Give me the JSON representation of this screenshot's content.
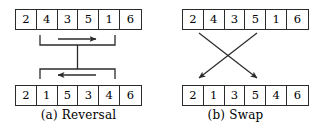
{
  "figure": {
    "panels": [
      {
        "id": "reversal",
        "caption_tag": "(a)",
        "caption_label": "Reversal",
        "input_array": {
          "label": "input-array",
          "values": [
            "2",
            "4",
            "3",
            "5",
            "1",
            "6"
          ]
        },
        "output_array": {
          "label": "output-array",
          "values": [
            "2",
            "1",
            "5",
            "3",
            "4",
            "6"
          ]
        },
        "operation": {
          "type": "reversal",
          "upper_bracket": {
            "arrow_direction": "right",
            "arrow_glyph": "→",
            "spans_indices": [
              1,
              4
            ]
          },
          "lower_bracket": {
            "arrow_direction": "left",
            "arrow_glyph": "←",
            "spans_indices": [
              1,
              4
            ]
          },
          "connector": "vertical-line"
        }
      },
      {
        "id": "swap",
        "caption_tag": "(b)",
        "caption_label": "Swap",
        "input_array": {
          "label": "input-array",
          "values": [
            "2",
            "4",
            "3",
            "5",
            "1",
            "6"
          ]
        },
        "output_array": {
          "label": "output-array",
          "values": [
            "2",
            "1",
            "3",
            "5",
            "4",
            "6"
          ]
        },
        "operation": {
          "type": "swap",
          "arrows": [
            {
              "from_index": 1,
              "to_index": 4,
              "direction": "down-right"
            },
            {
              "from_index": 4,
              "to_index": 1,
              "direction": "down-left"
            }
          ]
        }
      }
    ],
    "colors": {
      "stroke": "#2b2b2b",
      "text": "#000000",
      "background": "#ffffff"
    }
  }
}
